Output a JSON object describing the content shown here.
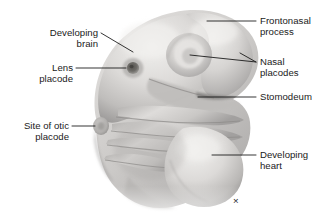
{
  "figure": {
    "background_color": "#ffffff",
    "text_color": "#1a1a1a",
    "leader_color": "#111111",
    "artist_mark": "×"
  },
  "labels": {
    "developing_brain": {
      "line1": "Developing",
      "line2": "brain"
    },
    "lens_placode": {
      "line1": "Lens",
      "line2": "placode"
    },
    "site_of_otic_placode": {
      "line1": "Site of otic",
      "line2": "placode"
    },
    "frontonasal_process": {
      "line1": "Frontonasal",
      "line2": "process"
    },
    "nasal_placodes": {
      "line1": "Nasal",
      "line2": "placodes"
    },
    "stomodeum": {
      "line1": "Stomodeum",
      "line2": ""
    },
    "developing_heart": {
      "line1": "Developing",
      "line2": "heart"
    }
  },
  "specimen": {
    "palette": {
      "highlight": "#f2f1ef",
      "light": "#dedcda",
      "mid": "#c6c4c2",
      "shade": "#a9a7a6",
      "dark": "#8d8b8a",
      "deepest": "#6d6b6a",
      "pit": "#4a4846"
    }
  }
}
